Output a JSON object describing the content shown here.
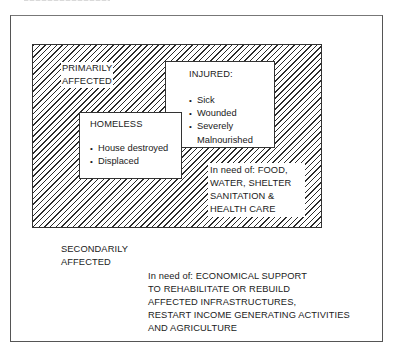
{
  "diagram": {
    "primary": {
      "label": "PRIMARILY\nAFFECTED",
      "needs": "In need of: FOOD,\nWATER, SHELTER\nSANITATION &\nHEALTH CARE"
    },
    "injured": {
      "title": "INJURED:",
      "items": [
        "Sick",
        "Wounded",
        "Severely\nMalnourished"
      ]
    },
    "homeless": {
      "title": "HOMELESS",
      "items": [
        "House destroyed",
        "Displaced"
      ]
    },
    "secondary": {
      "label": "SECONDARILY\nAFFECTED",
      "needs": "In need of: ECONOMICAL SUPPORT\nTO REHABILITATE OR REBUILD\nAFFECTED INFRASTRUCTURES,\nRESTART INCOME GENERATING ACTIVITIES\nAND AGRICULTURE"
    }
  }
}
